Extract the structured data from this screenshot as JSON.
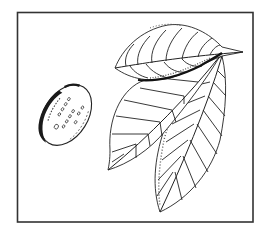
{
  "illustration": {
    "subject": "Botanical line drawing of a nut and three leaves",
    "frame_color": "#333333",
    "ink_color": "#222222",
    "background": "#ffffff",
    "elements": [
      {
        "name": "nut",
        "description": "Oval nut/seed with dark stippled shading and small dot markings"
      },
      {
        "name": "leaf-top",
        "description": "Horizontal leaf with pointed tip to the right"
      },
      {
        "name": "leaf-left",
        "description": "Broad leaf pointing down-left"
      },
      {
        "name": "leaf-right",
        "description": "Long leaf pointing down"
      }
    ]
  }
}
